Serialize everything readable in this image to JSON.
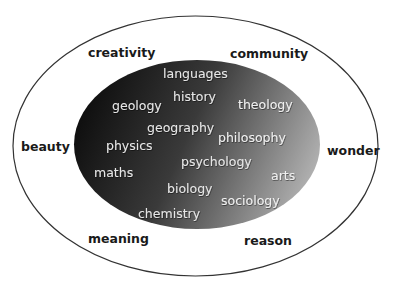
{
  "diagram": {
    "type": "nested-ellipse",
    "outer_ring": {
      "label": "outer-values",
      "stroke_color": "#333333",
      "fill_color": "#ffffff",
      "items": [
        {
          "label": "creativity",
          "x": 88,
          "y": 57
        },
        {
          "label": "community",
          "x": 230,
          "y": 58
        },
        {
          "label": "beauty",
          "x": 21,
          "y": 151
        },
        {
          "label": "wonder",
          "x": 327,
          "y": 155
        },
        {
          "label": "meaning",
          "x": 88,
          "y": 243
        },
        {
          "label": "reason",
          "x": 244,
          "y": 245
        }
      ]
    },
    "inner_core": {
      "label": "subjects",
      "gradient_start": "#0d0d0d",
      "gradient_mid": "#3a3a3a",
      "gradient_end": "#b4b4b4",
      "items": [
        {
          "label": "languages",
          "x": 163,
          "y": 78
        },
        {
          "label": "history",
          "x": 173,
          "y": 101
        },
        {
          "label": "geology",
          "x": 112,
          "y": 110
        },
        {
          "label": "theology",
          "x": 238,
          "y": 109
        },
        {
          "label": "geography",
          "x": 147,
          "y": 132
        },
        {
          "label": "philosophy",
          "x": 218,
          "y": 142
        },
        {
          "label": "physics",
          "x": 106,
          "y": 150
        },
        {
          "label": "psychology",
          "x": 181,
          "y": 166
        },
        {
          "label": "maths",
          "x": 94,
          "y": 177
        },
        {
          "label": "arts",
          "x": 271,
          "y": 180
        },
        {
          "label": "biology",
          "x": 167,
          "y": 193
        },
        {
          "label": "sociology",
          "x": 221,
          "y": 205
        },
        {
          "label": "chemistry",
          "x": 138,
          "y": 218
        }
      ]
    }
  }
}
